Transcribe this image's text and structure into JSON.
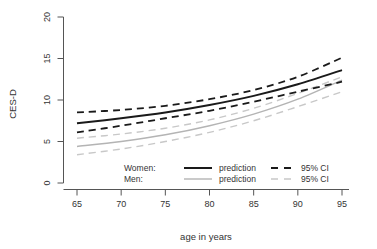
{
  "chart_data": {
    "type": "line",
    "title": "",
    "xlabel": "age in years",
    "ylabel": "CES-D",
    "xlim": [
      64,
      96
    ],
    "ylim": [
      0,
      20
    ],
    "xticks": [
      65,
      70,
      75,
      80,
      85,
      90,
      95
    ],
    "yticks": [
      0,
      5,
      10,
      15,
      20
    ],
    "grid": false,
    "legend_position": "bottom-center-inside",
    "x": [
      65,
      70,
      75,
      80,
      85,
      90,
      95
    ],
    "series": [
      {
        "name": "Women prediction",
        "group": "Women",
        "role": "prediction",
        "style": "solid",
        "color": "#1a1a1a",
        "values": [
          7.2,
          7.8,
          8.5,
          9.4,
          10.5,
          11.9,
          13.6
        ]
      },
      {
        "name": "Women 95% CI upper",
        "group": "Women",
        "role": "95% CI",
        "style": "dashed",
        "color": "#1a1a1a",
        "values": [
          8.5,
          8.8,
          9.3,
          10.1,
          11.2,
          12.8,
          15.1
        ]
      },
      {
        "name": "Women 95% CI lower",
        "group": "Women",
        "role": "95% CI",
        "style": "dashed",
        "color": "#1a1a1a",
        "values": [
          6.1,
          6.9,
          7.8,
          8.7,
          9.8,
          11.0,
          12.2
        ]
      },
      {
        "name": "Men prediction",
        "group": "Men",
        "role": "prediction",
        "style": "solid",
        "color": "#b4b4b4",
        "values": [
          4.4,
          5.0,
          5.8,
          6.9,
          8.3,
          10.1,
          12.4
        ]
      },
      {
        "name": "Men 95% CI upper",
        "group": "Men",
        "role": "95% CI",
        "style": "dashed",
        "color": "#c8c8c8",
        "values": [
          5.4,
          5.9,
          6.6,
          7.6,
          9.0,
          10.8,
          12.8
        ]
      },
      {
        "name": "Men 95% CI lower",
        "group": "Men",
        "role": "95% CI",
        "style": "dashed",
        "color": "#c8c8c8",
        "values": [
          3.4,
          4.1,
          5.0,
          6.1,
          7.5,
          9.2,
          11.0
        ]
      }
    ],
    "legend": {
      "rows": [
        {
          "group_label": "Women:",
          "prediction_label": "prediction",
          "ci_label": "95% CI",
          "color": "#1a1a1a"
        },
        {
          "group_label": "Men:",
          "prediction_label": "prediction",
          "ci_label": "95% CI",
          "color": "#b4b4b4"
        }
      ]
    },
    "colors": {
      "women": "#1a1a1a",
      "men": "#b4b4b4",
      "axis": "#555555",
      "background": "#ffffff"
    }
  },
  "axes": {
    "y_title": "CES-D",
    "x_title": "age in years",
    "y_tick_labels": [
      "0",
      "5",
      "10",
      "15",
      "20"
    ],
    "x_tick_labels": [
      "65",
      "70",
      "75",
      "80",
      "85",
      "90",
      "95"
    ]
  },
  "legend": {
    "women_label": "Women:",
    "men_label": "Men:",
    "women_prediction": "prediction",
    "men_prediction": "prediction",
    "women_ci": "95% CI",
    "men_ci": "95% CI"
  }
}
